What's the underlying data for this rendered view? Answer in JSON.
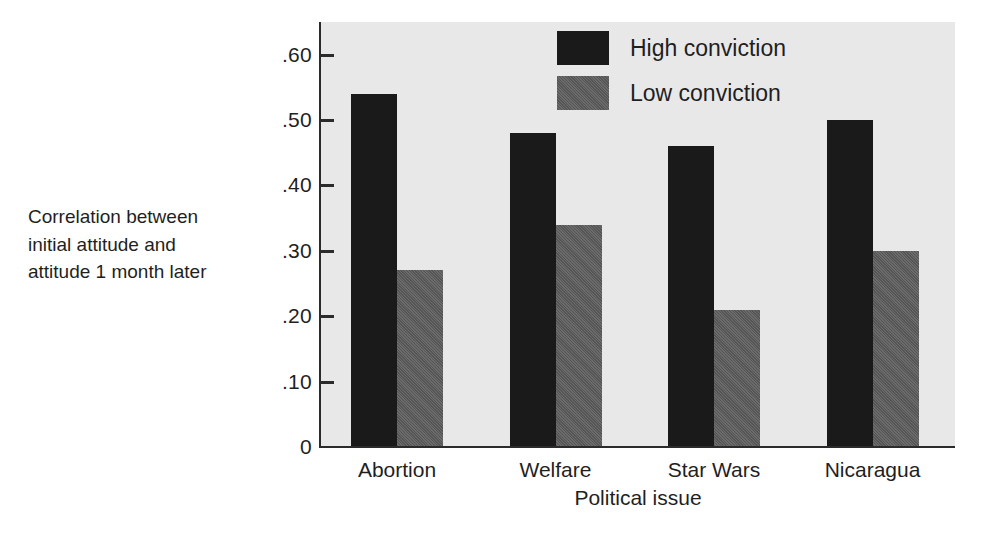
{
  "chart_data": {
    "type": "bar",
    "title": "",
    "xlabel": "Political issue",
    "ylabel": "Correlation between initial attitude and attitude 1 month later",
    "ylabel_lines": [
      "Correlation between",
      "initial attitude and",
      "attitude 1 month later"
    ],
    "categories": [
      "Abortion",
      "Welfare",
      "Star Wars",
      "Nicaragua"
    ],
    "series": [
      {
        "name": "High conviction",
        "color": "#1a1a1a",
        "values": [
          0.54,
          0.48,
          0.46,
          0.5
        ]
      },
      {
        "name": "Low conviction",
        "color": "#565656",
        "values": [
          0.27,
          0.34,
          0.21,
          0.3
        ]
      }
    ],
    "ylim": [
      0,
      0.65
    ],
    "y_ticks": [
      0,
      0.1,
      0.2,
      0.3,
      0.4,
      0.5,
      0.6
    ],
    "y_tick_labels": [
      "0",
      ".10",
      ".20",
      ".30",
      ".40",
      ".50",
      ".60"
    ],
    "grid": false,
    "legend_position": "top-center",
    "plot_background": "#e8e8e8",
    "page_background": "#ffffff"
  },
  "legend": {
    "items": [
      {
        "label": "High conviction",
        "swatch": "high"
      },
      {
        "label": "Low conviction",
        "swatch": "low"
      }
    ]
  }
}
